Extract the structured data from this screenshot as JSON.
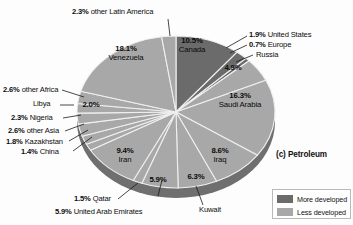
{
  "caption": "(c) Petroleum",
  "legend": {
    "items": [
      {
        "label": "More developed",
        "color": "#6b6b6b"
      },
      {
        "label": "Less developed",
        "color": "#a8a8a8"
      }
    ]
  },
  "chart_data": {
    "type": "pie",
    "title": "(c) Petroleum",
    "legend_position": "bottom-right",
    "categories": [
      "Canada",
      "United States",
      "Europe",
      "Russia",
      "Saudi Arabia",
      "Iraq",
      "Kuwait",
      "United Arab Emirates",
      "Qatar",
      "Iran",
      "China",
      "Kazakhstan",
      "other Asia",
      "Nigeria",
      "Libya",
      "other Africa",
      "Venezuela",
      "other Latin America"
    ],
    "values": [
      10.5,
      1.9,
      0.7,
      4.9,
      16.3,
      8.6,
      6.3,
      5.9,
      1.5,
      9.4,
      1.4,
      1.8,
      2.6,
      2.3,
      2.0,
      2.6,
      18.1,
      2.3
    ],
    "units": "percent",
    "groups": [
      "More developed",
      "More developed",
      "More developed",
      "Less developed",
      "Less developed",
      "Less developed",
      "Less developed",
      "Less developed",
      "Less developed",
      "Less developed",
      "Less developed",
      "Less developed",
      "Less developed",
      "Less developed",
      "Less developed",
      "Less developed",
      "Less developed",
      "Less developed"
    ],
    "slice_colors": {
      "more_developed": "#6b6b6b",
      "less_developed": "#a8a8a8"
    }
  },
  "labels": {
    "latin_america_pct": "2.3%",
    "latin_america_name": " other Latin America",
    "united_states_pct": "1.9%",
    "united_states_name": " United States",
    "europe_pct": "0.7%",
    "europe_name": " Europe",
    "russia_name": "Russia",
    "russia_pct": "4.9%",
    "canada_pct": "10.5%",
    "canada_name": "Canada",
    "saudi_pct": "16.3%",
    "saudi_name": "Saudi Arabia",
    "iraq_pct": "8.6%",
    "iraq_name": "Iraq",
    "kuwait_pct": "6.3%",
    "kuwait_name": "Kuwait",
    "uae_pct": "5.9%",
    "uae_pct2": "5.9%",
    "uae_name": " United Arab Emirates",
    "qatar_pct": "1.5%",
    "qatar_name": " Qatar",
    "iran_pct": "9.4%",
    "iran_name": "Iran",
    "china_pct": "1.4%",
    "china_name": " China",
    "kazakhstan_pct": "1.8%",
    "kazakhstan_name": " Kazakhstan",
    "other_asia_pct": "2.6%",
    "other_asia_name": " other Asia",
    "nigeria_pct": "2.3%",
    "nigeria_name": " Nigeria",
    "libya_name": "Libya",
    "libya_pct": "2.0%",
    "other_africa_pct": "2.6%",
    "other_africa_name": " other Africa",
    "venezuela_pct": "18.1%",
    "venezuela_name": "Venezuela"
  }
}
